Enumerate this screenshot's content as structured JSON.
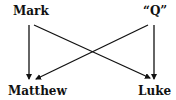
{
  "diagram": {
    "nodes": {
      "mark": "Mark",
      "q": "“Q”",
      "matthew": "Matthew",
      "luke": "Luke"
    },
    "edges": [
      {
        "from": "Mark",
        "to": "Matthew"
      },
      {
        "from": "Mark",
        "to": "Luke"
      },
      {
        "from": "“Q”",
        "to": "Matthew"
      },
      {
        "from": "“Q”",
        "to": "Luke"
      }
    ],
    "colors": {
      "line": "#111111",
      "text": "#111111",
      "background": "#ffffff"
    }
  }
}
